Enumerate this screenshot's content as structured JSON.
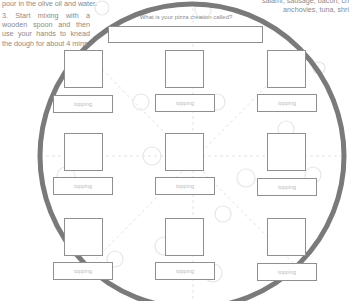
{
  "instructions": {
    "top_line": "pour in the olive oil and water.",
    "step3": "3. Start mixing with a wooden spoon and then use your hands to knead the dough for about 4 mins."
  },
  "topright_text": {
    "line1": "salami, sausage, bacon, ch",
    "line2": "anchovies, tuna, shri"
  },
  "pizza": {
    "title_prompt": "What is your pizza creation called?",
    "title_value": "",
    "slots": [
      {
        "row": 1,
        "col": 1,
        "topping_label": "topping"
      },
      {
        "row": 1,
        "col": 2,
        "topping_label": "topping"
      },
      {
        "row": 1,
        "col": 3,
        "topping_label": "topping"
      },
      {
        "row": 2,
        "col": 1,
        "topping_label": "topping"
      },
      {
        "row": 2,
        "col": 2,
        "topping_label": "topping"
      },
      {
        "row": 2,
        "col": 3,
        "topping_label": "topping"
      },
      {
        "row": 3,
        "col": 1,
        "topping_label": "topping"
      },
      {
        "row": 3,
        "col": 2,
        "topping_label": "topping"
      },
      {
        "row": 3,
        "col": 3,
        "topping_label": "topping"
      }
    ]
  },
  "colors": {
    "crust": "#7a7a7a",
    "box_border": "#8f8f8f",
    "dashes": "#e2e2e2"
  }
}
